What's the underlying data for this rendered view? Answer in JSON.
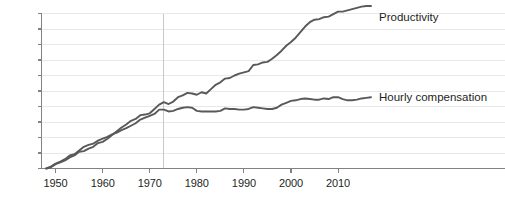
{
  "chart_data": {
    "type": "line",
    "title": "",
    "subtitle": "",
    "xlabel": "",
    "ylabel": "",
    "xlim": [
      1947,
      2017
    ],
    "ylim": [
      0,
      250
    ],
    "grid": true,
    "grid_axis": "y",
    "legend_position": "right-inline",
    "y_ticks": [
      0,
      25,
      50,
      75,
      100,
      125,
      150,
      175,
      200,
      225,
      250
    ],
    "y_tick_labels": [
      "0%",
      "25%",
      "50%",
      "75%",
      "100%",
      "125%",
      "150%",
      "175%",
      "200%",
      "225%",
      "250%"
    ],
    "x_ticks": [
      1950,
      1960,
      1970,
      1980,
      1990,
      2000,
      2010
    ],
    "x_tick_labels": [
      "1950",
      "1960",
      "1970",
      "1980",
      "1990",
      "2000",
      "2010"
    ],
    "annotations": [
      {
        "type": "vline",
        "x": 1973,
        "label": ""
      }
    ],
    "colors": {
      "productivity": "#58595b",
      "hourly_compensation": "#58595b",
      "gridline": "#e8e8e8",
      "axis": "#808285",
      "text": "#231f20",
      "background": "#ffffff"
    },
    "series": [
      {
        "name": "Productivity",
        "label": "Productivity",
        "x": [
          1948,
          1949,
          1950,
          1951,
          1952,
          1953,
          1954,
          1955,
          1956,
          1957,
          1958,
          1959,
          1960,
          1961,
          1962,
          1963,
          1964,
          1965,
          1966,
          1967,
          1968,
          1969,
          1970,
          1971,
          1972,
          1973,
          1974,
          1975,
          1976,
          1977,
          1978,
          1979,
          1980,
          1981,
          1982,
          1983,
          1984,
          1985,
          1986,
          1987,
          1988,
          1989,
          1990,
          1991,
          1992,
          1993,
          1994,
          1995,
          1996,
          1997,
          1998,
          1999,
          2000,
          2001,
          2002,
          2003,
          2004,
          2005,
          2006,
          2007,
          2008,
          2009,
          2010,
          2011,
          2012,
          2013,
          2014,
          2015,
          2016,
          2017
        ],
        "values": [
          0,
          2,
          7,
          10,
          13,
          18,
          21,
          27,
          28,
          32,
          35,
          41,
          43,
          48,
          54,
          60,
          66,
          71,
          77,
          80,
          86,
          87,
          89,
          96,
          103,
          107,
          104,
          108,
          115,
          118,
          122,
          121,
          119,
          123,
          121,
          128,
          135,
          139,
          145,
          146,
          150,
          153,
          155,
          157,
          167,
          168,
          171,
          172,
          177,
          183,
          190,
          198,
          204,
          211,
          220,
          229,
          236,
          240,
          241,
          244,
          245,
          249,
          253,
          253,
          255,
          257,
          259,
          261,
          262,
          262
        ],
        "final_value_pct": 243
      },
      {
        "name": "Hourly compensation",
        "label": "Hourly compensation",
        "x": [
          1948,
          1949,
          1950,
          1951,
          1952,
          1953,
          1954,
          1955,
          1956,
          1957,
          1958,
          1959,
          1960,
          1961,
          1962,
          1963,
          1964,
          1965,
          1966,
          1967,
          1968,
          1969,
          1970,
          1971,
          1972,
          1973,
          1974,
          1975,
          1976,
          1977,
          1978,
          1979,
          1980,
          1981,
          1982,
          1983,
          1984,
          1985,
          1986,
          1987,
          1988,
          1989,
          1990,
          1991,
          1992,
          1993,
          1994,
          1995,
          1996,
          1997,
          1998,
          1999,
          2000,
          2001,
          2002,
          2003,
          2004,
          2005,
          2006,
          2007,
          2008,
          2009,
          2010,
          2011,
          2012,
          2013,
          2014,
          2015,
          2016,
          2017
        ],
        "values": [
          0,
          3,
          8,
          11,
          15,
          21,
          23,
          29,
          35,
          38,
          40,
          45,
          48,
          51,
          55,
          58,
          62,
          65,
          69,
          73,
          79,
          82,
          85,
          88,
          95,
          95,
          92,
          93,
          96,
          98,
          99,
          98,
          93,
          92,
          92,
          92,
          92,
          93,
          97,
          96,
          96,
          95,
          95,
          96,
          99,
          98,
          97,
          96,
          96,
          98,
          103,
          106,
          109,
          110,
          112,
          113,
          112,
          111,
          111,
          113,
          112,
          115,
          115,
          112,
          110,
          110,
          111,
          113,
          114,
          115
        ],
        "final_value_pct": 115
      }
    ]
  }
}
